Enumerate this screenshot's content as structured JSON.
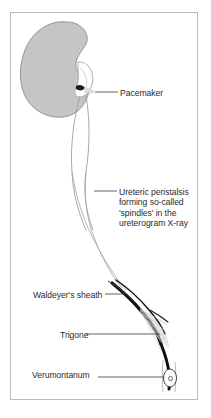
{
  "figure": {
    "frame_border_color": "#b9b9b9",
    "background_color": "#ffffff"
  },
  "colors": {
    "kidney_fill": "#c5c5c5",
    "kidney_outline": "#8a8a8a",
    "ureter_outline": "#9a9a9a",
    "sheath_dark": "#111111",
    "trigone_fibers": "#b0b0b0",
    "leader_line": "#3a3a3a",
    "label_text": "#2b2b2b",
    "caption_text": "#8e8e8e"
  },
  "labels": [
    {
      "id": "pacemaker",
      "text": "Pacemaker",
      "leader": "horizontal-left",
      "points_to": "pelvi-ureteric-junction"
    },
    {
      "id": "peristalsis",
      "lines": [
        "Ureteric peristalsis",
        "forming so-called",
        "'spindles' in the",
        "ureterogram X-ray"
      ],
      "leader": "horizontal-left",
      "points_to": "mid-ureter-spindle"
    },
    {
      "id": "waldeyer",
      "text": "Waldeyer's sheath",
      "leader": "horizontal-right",
      "points_to": "distal-ureteric-sheath"
    },
    {
      "id": "trigone",
      "text": "Trigone",
      "leader": "horizontal-right",
      "points_to": "bladder-trigone"
    },
    {
      "id": "verumontanum",
      "text": "Verumontanum",
      "leader": "horizontal-right",
      "points_to": "verumontanum-ring"
    }
  ],
  "anatomy": {
    "kidney": "left kidney, bean-shaped, grey filled",
    "ureter": "fusiform spindle segments descending from renal pelvis",
    "sheath": "thickened dark distal ureteric muscular sheath",
    "trigone": "fan of muscle fibres spreading into bladder base",
    "verumontanum": "small oval ring at distal termination"
  },
  "caption": {
    "text": ""
  }
}
